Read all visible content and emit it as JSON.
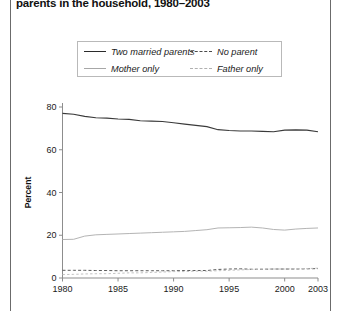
{
  "figure": {
    "title": "parents in the household, 1980–2003",
    "border_color": "#6b6b6b"
  },
  "legend": {
    "position": "top-center",
    "items": [
      {
        "label": "Two married parents",
        "style": "solid",
        "color": "#3a3a3a"
      },
      {
        "label": "No parent",
        "style": "dashed",
        "color": "#5a5a5a"
      },
      {
        "label": "Mother only",
        "style": "solid",
        "color": "#b4b4b4"
      },
      {
        "label": "Father only",
        "style": "dashed",
        "color": "#c2c2c2"
      }
    ]
  },
  "chart_data": {
    "type": "line",
    "title": "parents in the household, 1980–2003",
    "xlabel": "",
    "ylabel": "Percent",
    "xlim": [
      1980,
      2003
    ],
    "ylim": [
      0,
      80
    ],
    "grid": false,
    "legend_position": "top-center",
    "xticks": [
      1980,
      1985,
      1990,
      1995,
      2000,
      2003
    ],
    "xticklabels": [
      "1980",
      "1985",
      "1990",
      "1995",
      "2000",
      "2003"
    ],
    "yticks": [
      0,
      20,
      40,
      60,
      80
    ],
    "yticklabels": [
      "0",
      "20",
      "40",
      "60",
      "80"
    ],
    "x": [
      1980,
      1981,
      1982,
      1983,
      1984,
      1985,
      1986,
      1987,
      1988,
      1989,
      1990,
      1991,
      1992,
      1993,
      1994,
      1995,
      1996,
      1997,
      1998,
      1999,
      2000,
      2001,
      2002,
      2003
    ],
    "series": [
      {
        "name": "Two married parents",
        "style": "solid",
        "color": "#3a3a3a",
        "values": [
          77.0,
          76.6,
          75.6,
          75.0,
          74.8,
          74.4,
          74.2,
          73.6,
          73.4,
          73.2,
          72.6,
          72.0,
          71.4,
          70.8,
          69.4,
          69.0,
          68.8,
          68.8,
          68.6,
          68.4,
          69.2,
          69.3,
          69.2,
          68.4
        ]
      },
      {
        "name": "Mother only",
        "style": "solid",
        "color": "#b4b4b4",
        "values": [
          18.0,
          18.1,
          19.6,
          20.2,
          20.4,
          20.6,
          20.8,
          21.0,
          21.2,
          21.4,
          21.6,
          21.8,
          22.2,
          22.6,
          23.4,
          23.5,
          23.6,
          23.8,
          23.4,
          22.7,
          22.4,
          22.9,
          23.2,
          23.4
        ]
      },
      {
        "name": "No parent",
        "style": "dashed",
        "color": "#5a5a5a",
        "values": [
          3.6,
          3.6,
          3.6,
          3.5,
          3.5,
          3.4,
          3.4,
          3.4,
          3.4,
          3.4,
          3.4,
          3.5,
          3.5,
          3.5,
          4.0,
          4.2,
          4.3,
          4.1,
          4.1,
          4.2,
          4.2,
          4.2,
          4.3,
          4.4
        ]
      },
      {
        "name": "Father only",
        "style": "dashed",
        "color": "#c2c2c2",
        "values": [
          1.6,
          1.7,
          1.9,
          2.0,
          2.0,
          2.2,
          2.4,
          2.4,
          2.6,
          2.8,
          3.0,
          3.0,
          3.2,
          3.2,
          3.4,
          3.6,
          3.8,
          4.0,
          4.2,
          4.2,
          4.2,
          4.3,
          4.4,
          4.6
        ]
      }
    ]
  }
}
